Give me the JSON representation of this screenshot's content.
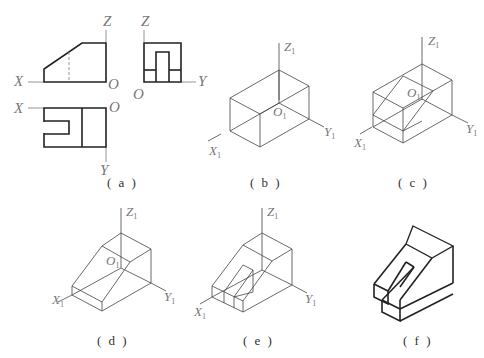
{
  "figure": {
    "panels": [
      {
        "id": "a",
        "caption": "(a)",
        "description": "Three orthographic views: front, side, top"
      },
      {
        "id": "b",
        "caption": "(b)",
        "description": "Isometric bounding box"
      },
      {
        "id": "c",
        "caption": "(c)",
        "description": "Bounding box with inclined plane construction"
      },
      {
        "id": "d",
        "caption": "(d)",
        "description": "Inclined block after cutting"
      },
      {
        "id": "e",
        "caption": "(e)",
        "description": "Slot construction lines"
      },
      {
        "id": "f",
        "caption": "(f)",
        "description": "Finished isometric drawing"
      }
    ],
    "axis_labels": {
      "x": "X",
      "y": "Y",
      "z": "Z",
      "o": "O",
      "x1": "X",
      "y1": "Y",
      "z1": "Z",
      "o1": "O",
      "sub": "1"
    },
    "captions": {
      "a": "( a )",
      "b": "( b )",
      "c": "( c )",
      "d": "( d )",
      "e": "( e )",
      "f": "( f )"
    }
  }
}
